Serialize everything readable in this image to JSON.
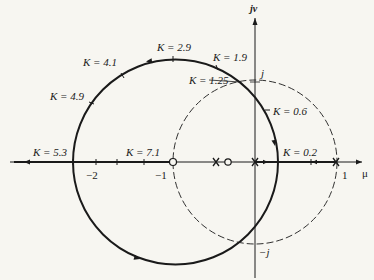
{
  "diagram": {
    "type": "root-locus",
    "axes": {
      "vertical_label": "jν",
      "horizontal_label": "μ",
      "ticks": [
        {
          "label": "−2",
          "value": -2
        },
        {
          "label": "−1",
          "value": -1
        },
        {
          "label": "1",
          "value": 1
        }
      ],
      "imag_marks": [
        {
          "label": "j",
          "value": 1
        },
        {
          "label": "−j",
          "value": -1
        }
      ]
    },
    "unit_circle": {
      "style": "dashed",
      "center": [
        0,
        0
      ],
      "radius": 1
    },
    "locus_circle": {
      "style": "solid",
      "center": [
        -0.97,
        0
      ],
      "radius": 1.25
    },
    "poles": [
      {
        "label": "x",
        "value": -0.3
      },
      {
        "label": "x",
        "value": 0
      },
      {
        "label": "x",
        "value": 1
      }
    ],
    "zeros": [
      {
        "label": "o",
        "value": -1
      },
      {
        "label": "o",
        "value": -0.15
      }
    ],
    "gain_labels": [
      {
        "text": "K = 2.9"
      },
      {
        "text": "K = 1.9"
      },
      {
        "text": "K = 4.1"
      },
      {
        "text": "K = 1.25"
      },
      {
        "text": "K = 4.9"
      },
      {
        "text": "K = 0.6"
      },
      {
        "text": "K = 5.3"
      },
      {
        "text": "K = 7.1"
      },
      {
        "text": "K = 0.2"
      }
    ]
  }
}
